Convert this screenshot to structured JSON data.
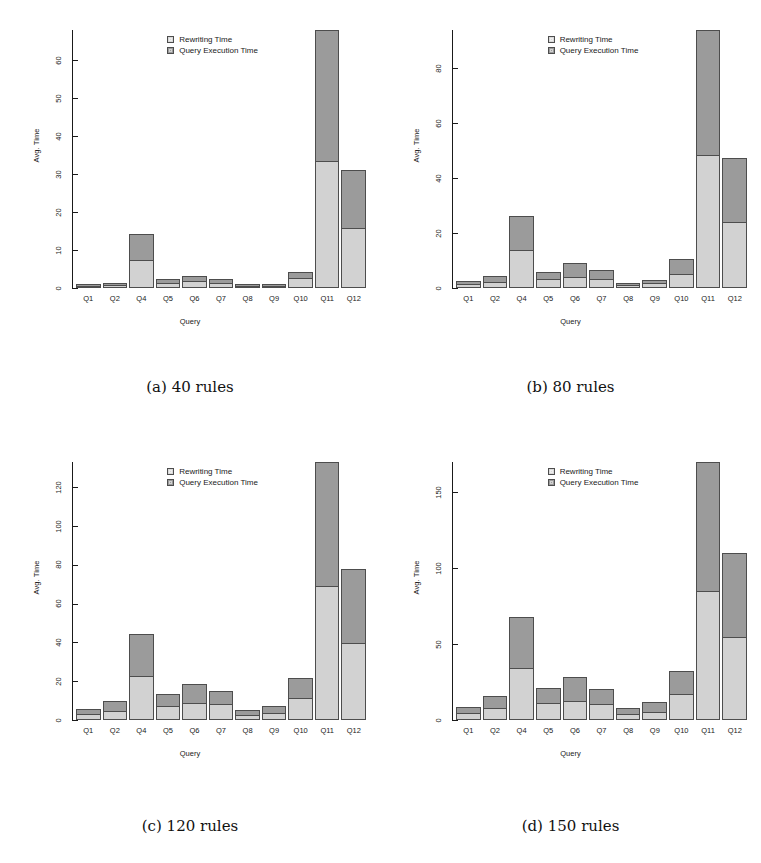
{
  "figure": {
    "panel_count": 4,
    "legend": {
      "rewriting_label": "Rewriting Time",
      "execution_label": "Query Execution Time",
      "rewriting_swatch": "rewriting-time-swatch",
      "execution_swatch": "query-execution-time-swatch",
      "colors": {
        "rewriting": "#d2d2d2",
        "execution": "#9b9b9b"
      }
    },
    "axis": {
      "xlabel": "Query",
      "ylabel": "Avg. Time"
    },
    "captions": [
      "(a) 40 rules",
      "(b) 80 rules",
      "(c) 120 rules",
      "(d) 150 rules"
    ]
  },
  "chart_data": [
    {
      "type": "bar",
      "stacked": true,
      "title": "(a) 40 rules",
      "xlabel": "Query",
      "ylabel": "Avg. Time",
      "grid": false,
      "legend_position": "top-center",
      "ylim": [
        0,
        68
      ],
      "yticks": [
        0,
        10,
        20,
        30,
        40,
        50,
        60
      ],
      "categories": [
        "Q1",
        "Q2",
        "Q4",
        "Q5",
        "Q6",
        "Q7",
        "Q8",
        "Q9",
        "Q10",
        "Q11",
        "Q12"
      ],
      "series": [
        {
          "name": "Rewriting Time",
          "color": "#d2d2d2",
          "values": [
            0.5,
            0.8,
            7.5,
            1.3,
            1.8,
            1.4,
            0.4,
            0.5,
            2.6,
            33.5,
            15.8
          ]
        },
        {
          "name": "Query Execution Time",
          "color": "#9b9b9b",
          "values": [
            0.4,
            0.6,
            6.8,
            1.0,
            1.3,
            1.0,
            0.4,
            0.5,
            1.7,
            34.5,
            15.4
          ]
        }
      ],
      "totals": [
        0.9,
        1.4,
        14.3,
        2.3,
        3.1,
        2.4,
        0.8,
        1.0,
        4.3,
        68.0,
        31.2
      ]
    },
    {
      "type": "bar",
      "stacked": true,
      "title": "(b) 80 rules",
      "xlabel": "Query",
      "ylabel": "Avg. Time",
      "grid": false,
      "legend_position": "top-center",
      "ylim": [
        0,
        94
      ],
      "yticks": [
        0,
        20,
        40,
        60,
        80
      ],
      "categories": [
        "Q1",
        "Q2",
        "Q4",
        "Q5",
        "Q6",
        "Q7",
        "Q8",
        "Q9",
        "Q10",
        "Q11",
        "Q12"
      ],
      "series": [
        {
          "name": "Rewriting Time",
          "color": "#d2d2d2",
          "values": [
            1.4,
            2.2,
            13.7,
            3.3,
            4.0,
            3.2,
            1.0,
            1.7,
            5.2,
            48.5,
            24.0
          ]
        },
        {
          "name": "Query Execution Time",
          "color": "#9b9b9b",
          "values": [
            1.3,
            2.0,
            12.7,
            2.7,
            5.2,
            3.2,
            1.0,
            1.4,
            5.3,
            45.5,
            23.5
          ]
        }
      ],
      "totals": [
        2.7,
        4.2,
        26.4,
        6.0,
        9.2,
        6.4,
        2.0,
        3.1,
        10.5,
        94.0,
        47.5
      ]
    },
    {
      "type": "bar",
      "stacked": true,
      "title": "(c) 120 rules",
      "xlabel": "Query",
      "ylabel": "Avg. Time",
      "grid": false,
      "legend_position": "top-center",
      "ylim": [
        0,
        133
      ],
      "yticks": [
        0,
        20,
        40,
        60,
        80,
        100,
        120
      ],
      "categories": [
        "Q1",
        "Q2",
        "Q4",
        "Q5",
        "Q6",
        "Q7",
        "Q8",
        "Q9",
        "Q10",
        "Q11",
        "Q12"
      ],
      "series": [
        {
          "name": "Rewriting Time",
          "color": "#d2d2d2",
          "values": [
            3.2,
            4.8,
            22.5,
            7.0,
            9.0,
            8.0,
            2.8,
            3.5,
            11.5,
            69.0,
            39.5
          ]
        },
        {
          "name": "Query Execution Time",
          "color": "#9b9b9b",
          "values": [
            2.3,
            5.2,
            22.0,
            6.5,
            9.5,
            7.0,
            2.6,
            3.5,
            10.0,
            64.0,
            38.5
          ]
        }
      ],
      "totals": [
        5.5,
        10.0,
        44.5,
        13.5,
        18.5,
        15.0,
        5.4,
        7.0,
        21.5,
        133.0,
        78.0
      ]
    },
    {
      "type": "bar",
      "stacked": true,
      "title": "(d) 150 rules",
      "xlabel": "Query",
      "ylabel": "Avg. Time",
      "grid": false,
      "legend_position": "top-center",
      "ylim": [
        0,
        170
      ],
      "yticks": [
        0,
        50,
        100,
        150
      ],
      "categories": [
        "Q1",
        "Q2",
        "Q4",
        "Q5",
        "Q6",
        "Q7",
        "Q8",
        "Q9",
        "Q10",
        "Q11",
        "Q12"
      ],
      "series": [
        {
          "name": "Rewriting Time",
          "color": "#d2d2d2",
          "values": [
            4.5,
            8.0,
            34.0,
            11.0,
            12.5,
            10.5,
            4.0,
            5.5,
            17.0,
            85.0,
            55.0
          ]
        },
        {
          "name": "Query Execution Time",
          "color": "#9b9b9b",
          "values": [
            4.0,
            7.5,
            34.0,
            10.0,
            16.0,
            10.0,
            4.0,
            6.5,
            15.0,
            85.0,
            55.0
          ]
        }
      ],
      "totals": [
        8.5,
        15.5,
        68.0,
        21.0,
        28.5,
        20.5,
        8.0,
        12.0,
        32.0,
        170.0,
        110.0
      ]
    }
  ]
}
